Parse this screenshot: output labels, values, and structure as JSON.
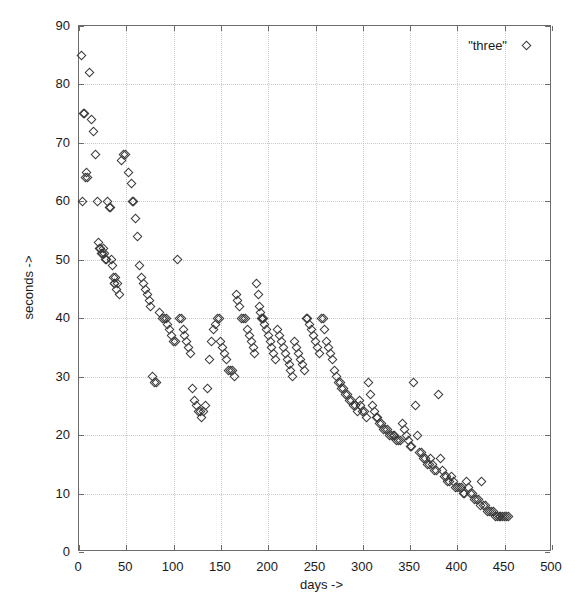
{
  "figure": {
    "width": 575,
    "height": 605,
    "background": "#ffffff",
    "frame_color": "#6b6b6b",
    "grid_color": "#c9c9c9",
    "marker_color": "#3a3a3a"
  },
  "legend": {
    "position": "top-right-inside",
    "entries": [
      {
        "label": "\"three\"",
        "marker": "open-diamond"
      }
    ]
  },
  "axes": {
    "x": {
      "title": "days ->",
      "min": 0,
      "max": 500,
      "ticks": [
        0,
        50,
        100,
        150,
        200,
        250,
        300,
        350,
        400,
        450,
        500
      ]
    },
    "y": {
      "title": "seconds ->",
      "min": 0,
      "max": 90,
      "ticks": [
        0,
        10,
        20,
        30,
        40,
        50,
        60,
        70,
        80,
        90
      ]
    }
  },
  "caption": {
    "text": ""
  },
  "chart_data": {
    "type": "scatter",
    "title": "",
    "xlabel": "days ->",
    "ylabel": "seconds ->",
    "xlim": [
      0,
      500
    ],
    "ylim": [
      0,
      90
    ],
    "grid": true,
    "legend_position": "upper right",
    "series": [
      {
        "name": "\"three\"",
        "marker": "open-diamond",
        "color": "#3a3a3a",
        "points": [
          [
            3,
            85
          ],
          [
            4,
            60
          ],
          [
            5,
            75
          ],
          [
            6,
            75
          ],
          [
            7,
            64
          ],
          [
            8,
            65
          ],
          [
            9,
            64
          ],
          [
            11,
            82
          ],
          [
            13,
            74
          ],
          [
            15,
            72
          ],
          [
            17,
            68
          ],
          [
            20,
            60
          ],
          [
            21,
            53
          ],
          [
            22,
            52
          ],
          [
            23,
            52
          ],
          [
            24,
            51
          ],
          [
            25,
            51
          ],
          [
            26,
            52
          ],
          [
            27,
            51
          ],
          [
            28,
            50
          ],
          [
            29,
            50
          ],
          [
            30,
            60
          ],
          [
            32,
            59
          ],
          [
            33,
            59
          ],
          [
            34,
            50
          ],
          [
            35,
            49
          ],
          [
            36,
            47
          ],
          [
            37,
            46
          ],
          [
            38,
            46
          ],
          [
            39,
            47
          ],
          [
            40,
            45
          ],
          [
            41,
            46
          ],
          [
            43,
            44
          ],
          [
            45,
            67
          ],
          [
            47,
            68
          ],
          [
            49,
            68
          ],
          [
            52,
            65
          ],
          [
            55,
            63
          ],
          [
            57,
            60
          ],
          [
            58,
            60
          ],
          [
            60,
            57
          ],
          [
            62,
            54
          ],
          [
            64,
            49
          ],
          [
            66,
            47
          ],
          [
            68,
            46
          ],
          [
            70,
            45
          ],
          [
            72,
            44
          ],
          [
            74,
            43
          ],
          [
            76,
            42
          ],
          [
            78,
            30
          ],
          [
            80,
            29
          ],
          [
            82,
            29
          ],
          [
            85,
            41
          ],
          [
            88,
            40
          ],
          [
            90,
            40
          ],
          [
            92,
            40
          ],
          [
            94,
            39
          ],
          [
            96,
            38
          ],
          [
            98,
            37
          ],
          [
            100,
            36
          ],
          [
            102,
            36
          ],
          [
            104,
            50
          ],
          [
            106,
            40
          ],
          [
            108,
            40
          ],
          [
            110,
            38
          ],
          [
            112,
            37
          ],
          [
            114,
            36
          ],
          [
            116,
            35
          ],
          [
            118,
            34
          ],
          [
            120,
            28
          ],
          [
            122,
            26
          ],
          [
            124,
            25
          ],
          [
            126,
            24
          ],
          [
            128,
            24
          ],
          [
            130,
            23
          ],
          [
            132,
            24
          ],
          [
            134,
            25
          ],
          [
            136,
            28
          ],
          [
            138,
            33
          ],
          [
            140,
            36
          ],
          [
            142,
            38
          ],
          [
            144,
            39
          ],
          [
            146,
            40
          ],
          [
            148,
            40
          ],
          [
            150,
            36
          ],
          [
            152,
            35
          ],
          [
            154,
            34
          ],
          [
            156,
            33
          ],
          [
            158,
            31
          ],
          [
            160,
            31
          ],
          [
            162,
            31
          ],
          [
            164,
            30
          ],
          [
            166,
            44
          ],
          [
            168,
            43
          ],
          [
            170,
            42
          ],
          [
            172,
            40
          ],
          [
            174,
            40
          ],
          [
            176,
            40
          ],
          [
            178,
            38
          ],
          [
            180,
            37
          ],
          [
            182,
            36
          ],
          [
            184,
            35
          ],
          [
            186,
            34
          ],
          [
            188,
            46
          ],
          [
            190,
            44
          ],
          [
            191,
            42
          ],
          [
            192,
            41
          ],
          [
            193,
            40
          ],
          [
            194,
            40
          ],
          [
            195,
            40
          ],
          [
            196,
            39
          ],
          [
            198,
            38
          ],
          [
            200,
            37
          ],
          [
            202,
            36
          ],
          [
            204,
            35
          ],
          [
            206,
            34
          ],
          [
            208,
            33
          ],
          [
            210,
            38
          ],
          [
            212,
            37
          ],
          [
            214,
            36
          ],
          [
            216,
            35
          ],
          [
            218,
            34
          ],
          [
            220,
            33
          ],
          [
            222,
            32
          ],
          [
            224,
            31
          ],
          [
            226,
            30
          ],
          [
            228,
            36
          ],
          [
            230,
            35
          ],
          [
            232,
            34
          ],
          [
            234,
            33
          ],
          [
            236,
            32
          ],
          [
            238,
            31
          ],
          [
            240,
            40
          ],
          [
            242,
            40
          ],
          [
            244,
            39
          ],
          [
            246,
            38
          ],
          [
            248,
            37
          ],
          [
            250,
            36
          ],
          [
            252,
            35
          ],
          [
            254,
            34
          ],
          [
            256,
            40
          ],
          [
            258,
            40
          ],
          [
            260,
            38
          ],
          [
            262,
            36
          ],
          [
            264,
            35
          ],
          [
            266,
            34
          ],
          [
            268,
            33
          ],
          [
            270,
            31
          ],
          [
            272,
            30
          ],
          [
            274,
            29
          ],
          [
            276,
            29
          ],
          [
            278,
            28
          ],
          [
            280,
            28
          ],
          [
            282,
            27
          ],
          [
            284,
            27
          ],
          [
            286,
            26
          ],
          [
            288,
            26
          ],
          [
            290,
            25
          ],
          [
            292,
            25
          ],
          [
            294,
            24
          ],
          [
            296,
            26
          ],
          [
            298,
            25
          ],
          [
            300,
            24
          ],
          [
            302,
            24
          ],
          [
            304,
            23
          ],
          [
            306,
            29
          ],
          [
            308,
            27
          ],
          [
            310,
            25
          ],
          [
            312,
            24
          ],
          [
            314,
            23
          ],
          [
            316,
            23
          ],
          [
            318,
            22
          ],
          [
            320,
            22
          ],
          [
            322,
            21
          ],
          [
            324,
            21
          ],
          [
            326,
            21
          ],
          [
            328,
            20
          ],
          [
            330,
            20
          ],
          [
            332,
            20
          ],
          [
            334,
            20
          ],
          [
            336,
            19
          ],
          [
            338,
            19
          ],
          [
            340,
            19
          ],
          [
            342,
            22
          ],
          [
            344,
            21
          ],
          [
            346,
            20
          ],
          [
            348,
            19
          ],
          [
            350,
            18
          ],
          [
            352,
            18
          ],
          [
            354,
            29
          ],
          [
            356,
            25
          ],
          [
            358,
            20
          ],
          [
            360,
            17
          ],
          [
            362,
            17
          ],
          [
            364,
            16
          ],
          [
            366,
            16
          ],
          [
            368,
            15
          ],
          [
            370,
            15
          ],
          [
            372,
            16
          ],
          [
            374,
            15
          ],
          [
            376,
            14
          ],
          [
            378,
            14
          ],
          [
            380,
            27
          ],
          [
            382,
            16
          ],
          [
            384,
            14
          ],
          [
            386,
            13
          ],
          [
            388,
            13
          ],
          [
            390,
            12
          ],
          [
            392,
            12
          ],
          [
            394,
            13
          ],
          [
            396,
            12
          ],
          [
            398,
            11
          ],
          [
            400,
            11
          ],
          [
            402,
            11
          ],
          [
            404,
            11
          ],
          [
            406,
            10
          ],
          [
            408,
            10
          ],
          [
            410,
            12
          ],
          [
            412,
            11
          ],
          [
            414,
            10
          ],
          [
            416,
            10
          ],
          [
            418,
            9
          ],
          [
            420,
            9
          ],
          [
            422,
            9
          ],
          [
            424,
            8
          ],
          [
            426,
            12
          ],
          [
            428,
            8
          ],
          [
            430,
            8
          ],
          [
            432,
            7
          ],
          [
            434,
            7
          ],
          [
            436,
            7
          ],
          [
            438,
            7
          ],
          [
            440,
            6
          ],
          [
            442,
            6
          ],
          [
            444,
            6
          ],
          [
            446,
            6
          ],
          [
            448,
            6
          ],
          [
            450,
            6
          ],
          [
            452,
            6
          ],
          [
            454,
            6
          ]
        ]
      }
    ]
  }
}
